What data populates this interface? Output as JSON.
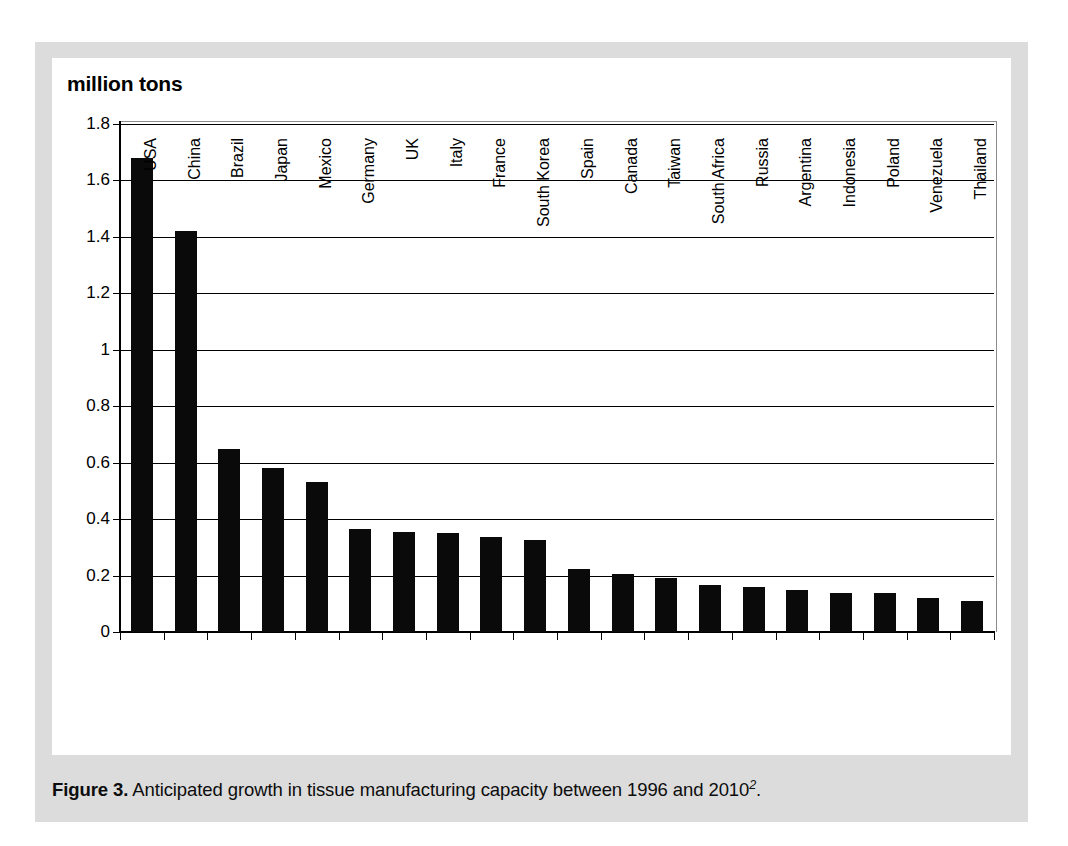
{
  "figure": {
    "axis_title": "million tons",
    "caption_label": "Figure 3.",
    "caption_text": "Anticipated growth in tissue manufacturing capacity between 1996 and 2010",
    "caption_superscript": "2",
    "caption_suffix": ".",
    "frame_color": "#dcdcdc",
    "bar_color": "#0a0a0a"
  },
  "chart_data": {
    "type": "bar",
    "title": "",
    "xlabel": "",
    "ylabel": "million tons",
    "ylim": [
      0,
      1.8
    ],
    "yticks": [
      0,
      0.2,
      0.4,
      0.6,
      0.8,
      1,
      1.2,
      1.4,
      1.6,
      1.8
    ],
    "ytick_labels": [
      "0",
      "0.2",
      "0.4",
      "0.6",
      "0.8",
      "1",
      "1.2",
      "1.4",
      "1.6",
      "1.8"
    ],
    "grid": true,
    "legend": false,
    "categories": [
      "USA",
      "China",
      "Brazil",
      "Japan",
      "Mexico",
      "Germany",
      "UK",
      "Italy",
      "France",
      "South Korea",
      "Spain",
      "Canada",
      "Taiwan",
      "South Africa",
      "Russia",
      "Argentina",
      "Indonesia",
      "Poland",
      "Venezuela",
      "Thailand"
    ],
    "values": [
      1.68,
      1.42,
      0.65,
      0.58,
      0.53,
      0.365,
      0.355,
      0.35,
      0.335,
      0.325,
      0.225,
      0.205,
      0.19,
      0.165,
      0.16,
      0.15,
      0.14,
      0.14,
      0.12,
      0.11
    ]
  }
}
